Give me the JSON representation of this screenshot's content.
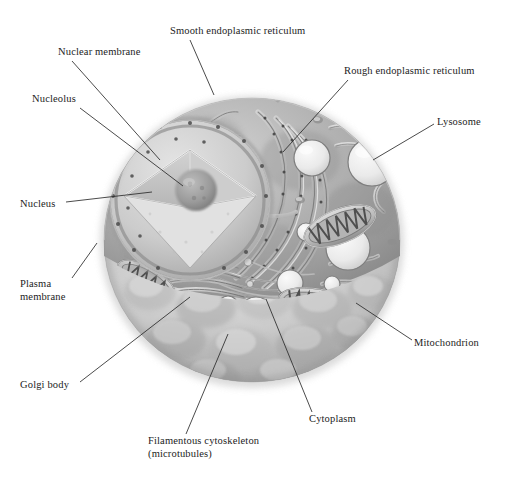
{
  "figure": {
    "background_color": "#ffffff",
    "ink_color": "#1c1c1c",
    "style": "grayscale airbrush textbook illustration"
  },
  "palette": {
    "outer_membrane_light": "#e3e3e3",
    "outer_membrane_mid": "#bdbdbd",
    "outer_membrane_dark": "#8f8f8f",
    "cytoplasm_light": "#d8d8d8",
    "cytoplasm_mid": "#a8a8a8",
    "cytoplasm_dark": "#7d7d7d",
    "nucleus_light": "#dcdcdc",
    "nucleus_mid": "#c4c4c4",
    "nucleolus": "#9b9b9b",
    "lysosome_fill": "#ececec",
    "membrane_line": "#6f6f6f",
    "leader_line": "#2a2a2a"
  },
  "labels": [
    {
      "id": "smooth-er",
      "text": "Smooth endoplasmic reticulum",
      "x": 170,
      "y": 25,
      "anchor": "start",
      "leader": {
        "x1": 190,
        "y1": 40,
        "x2": 214,
        "y2": 95
      }
    },
    {
      "id": "nuclear-membrane",
      "text": "Nuclear membrane",
      "x": 58,
      "y": 46,
      "anchor": "start",
      "leader": {
        "x1": 72,
        "y1": 61,
        "x2": 160,
        "y2": 160
      }
    },
    {
      "id": "nucleolus",
      "text": "Nucleolus",
      "x": 32,
      "y": 93,
      "anchor": "start",
      "leader": {
        "x1": 80,
        "y1": 108,
        "x2": 183,
        "y2": 186
      }
    },
    {
      "id": "rough-er",
      "text": "Rough endoplasmic reticulum",
      "x": 344,
      "y": 65,
      "anchor": "start",
      "leader": {
        "x1": 348,
        "y1": 80,
        "x2": 283,
        "y2": 152
      }
    },
    {
      "id": "lysosome",
      "text": "Lysosome",
      "x": 437,
      "y": 116,
      "anchor": "start",
      "leader": {
        "x1": 434,
        "y1": 124,
        "x2": 373,
        "y2": 160
      }
    },
    {
      "id": "nucleus",
      "text": "Nucleus",
      "x": 20,
      "y": 198,
      "anchor": "start",
      "leader": {
        "x1": 66,
        "y1": 202,
        "x2": 152,
        "y2": 192
      }
    },
    {
      "id": "plasma-membrane",
      "text": "Plasma",
      "text2": "membrane",
      "x": 20,
      "y": 278,
      "anchor": "start",
      "leader": {
        "x1": 72,
        "y1": 278,
        "x2": 97,
        "y2": 243
      }
    },
    {
      "id": "mitochondrion",
      "text": "Mitochondrion",
      "x": 414,
      "y": 337,
      "anchor": "start",
      "leader": {
        "x1": 412,
        "y1": 340,
        "x2": 356,
        "y2": 303
      }
    },
    {
      "id": "golgi-body",
      "text": "Golgi body",
      "x": 20,
      "y": 379,
      "anchor": "start",
      "leader": {
        "x1": 80,
        "y1": 382,
        "x2": 190,
        "y2": 297
      }
    },
    {
      "id": "cytoplasm",
      "text": "Cytoplasm",
      "x": 309,
      "y": 413,
      "anchor": "start",
      "leader": {
        "x1": 312,
        "y1": 412,
        "x2": 266,
        "y2": 299
      }
    },
    {
      "id": "filamentous-cytoskeleton",
      "text": "Filamentous cytoskeleton",
      "text2": "(microtubules)",
      "x": 148,
      "y": 435,
      "anchor": "start",
      "leader": {
        "x1": 186,
        "y1": 434,
        "x2": 228,
        "y2": 334
      }
    }
  ],
  "organelles": {
    "nucleus": {
      "cx": 190,
      "cy": 200,
      "r": 78,
      "note": "cut-away wedge exposes nucleolus"
    },
    "nucleolus": {
      "cx": 196,
      "cy": 190,
      "r": 20
    },
    "lysosomes": [
      {
        "cx": 372,
        "cy": 162,
        "r": 24
      },
      {
        "cx": 312,
        "cy": 158,
        "r": 18
      },
      {
        "cx": 348,
        "cy": 248,
        "r": 22
      },
      {
        "cx": 256,
        "cy": 314,
        "r": 17
      },
      {
        "cx": 198,
        "cy": 322,
        "r": 15
      },
      {
        "cx": 290,
        "cy": 283,
        "r": 13
      },
      {
        "cx": 306,
        "cy": 232,
        "r": 9
      }
    ],
    "mitochondria": [
      {
        "cx": 340,
        "cy": 226,
        "rx": 38,
        "ry": 17,
        "rot": -22,
        "cristae": 7
      },
      {
        "cx": 318,
        "cy": 305,
        "rx": 40,
        "ry": 16,
        "rot": 10,
        "cristae": 7
      },
      {
        "cx": 146,
        "cy": 280,
        "rx": 32,
        "ry": 14,
        "rot": 28,
        "cristae": 6
      }
    ],
    "golgi": {
      "cx": 200,
      "cy": 285,
      "stacks": 6
    },
    "cell_outline": {
      "cx": 252,
      "cy": 240,
      "rx": 148,
      "ry": 142
    }
  }
}
